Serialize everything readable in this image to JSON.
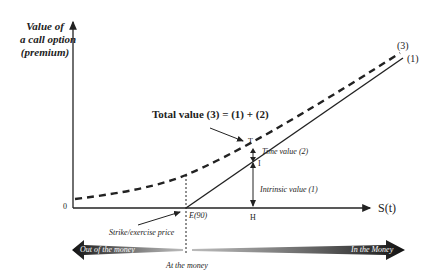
{
  "diagram": {
    "y_axis_label": [
      "Value of",
      "a call option",
      "(premium)"
    ],
    "x_axis_label": "S(t)",
    "origin_label": "0",
    "strike_label": "E(90)",
    "strike_caption": "Strike/exercise price",
    "h_label": "H",
    "t_label": "T",
    "i_label": "I",
    "time_value_label": "Time value (2)",
    "intrinsic_value_label": "Intrinsic value (1)",
    "total_value_label": "Total value (3) = (1) + (2)",
    "curve3_label": "(3)",
    "line1_label": "(1)",
    "out_of_money": "Out of the money",
    "at_the_money": "At the money",
    "in_the_money": "In the Money"
  }
}
